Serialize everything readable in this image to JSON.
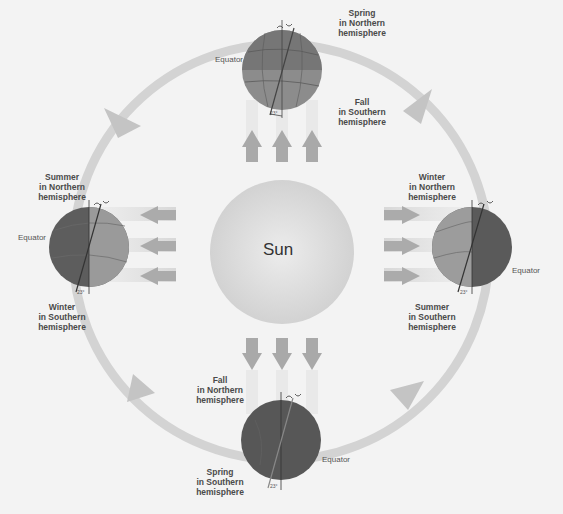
{
  "diagram": {
    "title": "",
    "sun": {
      "label": "Sun"
    },
    "positions": [
      {
        "id": "top",
        "season_north": "Spring\nin Northern\nhemisphere",
        "season_south": "Fall\nin Southern\nhemisphere",
        "equator_label": "Equator",
        "tilt_label": "23°"
      },
      {
        "id": "left",
        "season_north": "Summer\nin Northern\nhemisphere",
        "season_south": "Winter\nin Southern\nhemisphere",
        "equator_label": "Equator",
        "tilt_label": "23°"
      },
      {
        "id": "right",
        "season_north": "Winter\nin Northern\nhemisphere",
        "season_south": "Summer\nin Southern\nhemisphere",
        "equator_label": "Equator",
        "tilt_label": "23°"
      },
      {
        "id": "bottom",
        "season_north": "Fall\nin Northern\nhemisphere",
        "season_south": "Spring\nin Southern\nhemisphere",
        "equator_label": "Equator",
        "tilt_label": "23°"
      }
    ],
    "orbit_direction": "counterclockwise",
    "colors": {
      "background": "#f3f3f3",
      "orbit": "#cfcfcf",
      "sun": "#d9d9d9",
      "earth_dark": "#5e5e5e",
      "earth_light": "#9a9a9a",
      "ray_arrow": "#a8a8a8"
    }
  }
}
